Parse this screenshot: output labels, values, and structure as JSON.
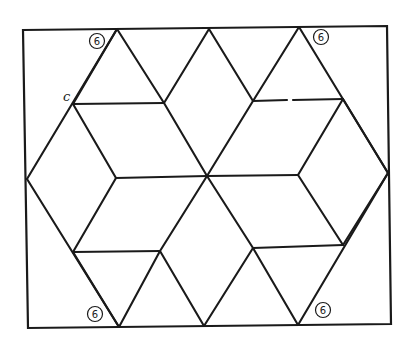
{
  "diagram": {
    "type": "geometric-line-drawing",
    "colors": {
      "background": "#ffffff",
      "stroke": "#1a1a1a"
    },
    "frame": {
      "tl": [
        23,
        30
      ],
      "tr": [
        387,
        26
      ],
      "br": [
        391,
        324
      ],
      "bl": [
        28,
        328
      ]
    },
    "center": [
      207,
      176
    ],
    "segments": [
      {
        "id": "hex-top-left",
        "from": [
          117,
          29
        ],
        "to": [
          27,
          179
        ]
      },
      {
        "id": "hex-bottom-left",
        "from": [
          27,
          179
        ],
        "to": [
          119,
          327
        ]
      },
      {
        "id": "hex-top-right",
        "from": [
          299,
          27
        ],
        "to": [
          388,
          173
        ]
      },
      {
        "id": "hex-bottom-right",
        "from": [
          388,
          173
        ],
        "to": [
          298,
          325
        ]
      },
      {
        "id": "top-apex-left",
        "from": [
          209,
          29
        ],
        "to": [
          164,
          103
        ]
      },
      {
        "id": "top-apex-right",
        "from": [
          209,
          29
        ],
        "to": [
          253,
          101
        ]
      },
      {
        "id": "bottom-apex-left",
        "from": [
          204,
          326
        ],
        "to": [
          160,
          251
        ]
      },
      {
        "id": "bottom-apex-right",
        "from": [
          204,
          326
        ],
        "to": [
          253,
          248
        ]
      },
      {
        "id": "upper-left-horizontal",
        "from": [
          73,
          104
        ],
        "to": [
          164,
          103
        ]
      },
      {
        "id": "upper-right-horizontal-a",
        "from": [
          253,
          101
        ],
        "to": [
          287,
          100
        ]
      },
      {
        "id": "upper-right-horizontal-b",
        "from": [
          293,
          100
        ],
        "to": [
          343,
          99
        ]
      },
      {
        "id": "lower-left-horizontal",
        "from": [
          73,
          252
        ],
        "to": [
          160,
          251
        ]
      },
      {
        "id": "lower-right-horizontal",
        "from": [
          253,
          248
        ],
        "to": [
          343,
          245
        ]
      },
      {
        "id": "mid-left-horizontal",
        "from": [
          116,
          178
        ],
        "to": [
          207,
          176
        ]
      },
      {
        "id": "mid-right-horizontal",
        "from": [
          207,
          176
        ],
        "to": [
          298,
          175
        ]
      },
      {
        "id": "ul-inner-to-center",
        "from": [
          164,
          103
        ],
        "to": [
          207,
          176
        ]
      },
      {
        "id": "ur-inner-to-center",
        "from": [
          253,
          101
        ],
        "to": [
          207,
          176
        ]
      },
      {
        "id": "ll-inner-to-center",
        "from": [
          160,
          251
        ],
        "to": [
          207,
          176
        ]
      },
      {
        "id": "lr-inner-to-center",
        "from": [
          253,
          248
        ],
        "to": [
          207,
          176
        ]
      },
      {
        "id": "c-to-mid-left",
        "from": [
          73,
          104
        ],
        "to": [
          116,
          178
        ]
      },
      {
        "id": "mid-left-to-ll",
        "from": [
          116,
          178
        ],
        "to": [
          73,
          252
        ]
      },
      {
        "id": "ur-junction-to-mid-right",
        "from": [
          343,
          99
        ],
        "to": [
          298,
          175
        ]
      },
      {
        "id": "mid-right-to-lr-junction",
        "from": [
          298,
          175
        ],
        "to": [
          343,
          245
        ]
      },
      {
        "id": "c-to-top-left-vertex-extension",
        "from": [
          73,
          104
        ],
        "to": [
          117,
          29
        ]
      },
      {
        "id": "ul-inner-to-hex-top-left",
        "from": [
          164,
          103
        ],
        "to": [
          117,
          29
        ]
      },
      {
        "id": "ur-inner-to-hex-top-right",
        "from": [
          253,
          101
        ],
        "to": [
          299,
          27
        ]
      },
      {
        "id": "ur-junction-to-right",
        "from": [
          343,
          99
        ],
        "to": [
          388,
          173
        ]
      },
      {
        "id": "ll-to-bottom-left-vertex",
        "from": [
          73,
          252
        ],
        "to": [
          119,
          327
        ]
      },
      {
        "id": "ll-inner-to-bottom-left-vertex",
        "from": [
          160,
          251
        ],
        "to": [
          119,
          327
        ]
      },
      {
        "id": "lr-inner-to-bottom-right-vertex",
        "from": [
          253,
          248
        ],
        "to": [
          298,
          325
        ]
      },
      {
        "id": "lr-junction-to-right",
        "from": [
          343,
          245
        ],
        "to": [
          388,
          173
        ]
      }
    ],
    "badges": [
      {
        "id": "badge-top-left",
        "label": "6",
        "cx": 97,
        "cy": 41
      },
      {
        "id": "badge-top-right",
        "label": "6",
        "cx": 321,
        "cy": 37
      },
      {
        "id": "badge-bottom-left",
        "label": "6",
        "cx": 95,
        "cy": 314
      },
      {
        "id": "badge-bottom-right",
        "label": "6",
        "cx": 323,
        "cy": 310
      }
    ],
    "point_labels": [
      {
        "id": "label-c",
        "text": "c",
        "x": 63,
        "y": 101
      }
    ]
  }
}
